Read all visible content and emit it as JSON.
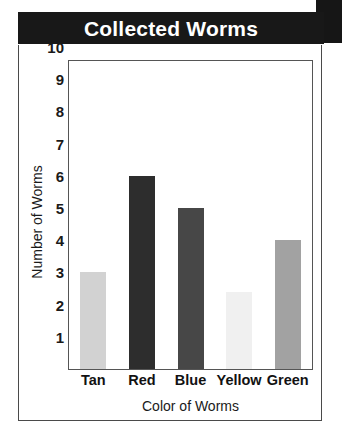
{
  "title": "Collected Worms",
  "corner_tab": {
    "name": "corner-tab",
    "color": "#161616"
  },
  "banner": {
    "background": "#181818",
    "text_color": "#ffffff"
  },
  "chart_data": {
    "type": "bar",
    "title": "Collected Worms",
    "xlabel": "Color of Worms",
    "ylabel": "Number of Worms",
    "categories": [
      "Tan",
      "Red",
      "Blue",
      "Yellow",
      "Green"
    ],
    "values": [
      3,
      6,
      5,
      2.4,
      4
    ],
    "bar_colors": [
      "#d2d2d2",
      "#2d2d2d",
      "#474747",
      "#f0f0f0",
      "#a2a2a2"
    ],
    "ylim": [
      0,
      10.3
    ],
    "ytick_labels": [
      "10",
      "9",
      "8",
      "7",
      "6",
      "5",
      "4",
      "3",
      "2",
      "1"
    ],
    "ytick_values": [
      10,
      9,
      8,
      7,
      6,
      5,
      4,
      3,
      2,
      1
    ],
    "grid": false,
    "legend": false
  }
}
